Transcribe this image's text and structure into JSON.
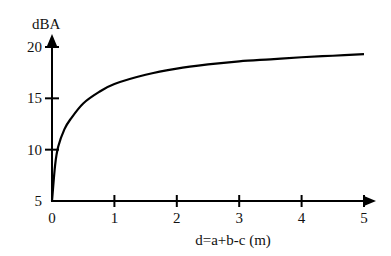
{
  "chart_data": {
    "type": "line",
    "title": "",
    "xlabel": "d=a+b-c (m)",
    "ylabel": "dBA",
    "xlim": [
      0,
      5
    ],
    "ylim": [
      5,
      20
    ],
    "x_ticks": [
      "0",
      "1",
      "2",
      "3",
      "4",
      "5"
    ],
    "y_ticks": [
      "5",
      "10",
      "15",
      "20"
    ],
    "grid": false,
    "legend": null,
    "series": [
      {
        "name": "attenuation",
        "x": [
          0,
          0.05,
          0.1,
          0.2,
          0.3,
          0.5,
          0.75,
          1.0,
          1.5,
          2.0,
          2.5,
          3.0,
          3.5,
          4.0,
          4.5,
          5.0
        ],
        "values": [
          5,
          8.5,
          10.3,
          12.0,
          13.0,
          14.5,
          15.6,
          16.4,
          17.3,
          17.9,
          18.3,
          18.6,
          18.8,
          19.0,
          19.15,
          19.3
        ]
      }
    ]
  },
  "axes": {
    "x_label": "d=a+b-c (m)",
    "y_label": "dBA",
    "origin_x_label": "0",
    "origin_y_label": "5"
  }
}
